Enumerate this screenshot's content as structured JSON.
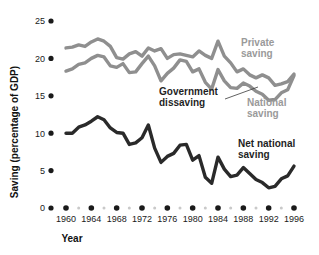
{
  "chart_data": {
    "type": "line",
    "title": "",
    "xlabel": "Year",
    "ylabel": "Saving (percentage of GDP)",
    "xlim": [
      1959,
      1997
    ],
    "ylim": [
      0,
      25
    ],
    "grid": false,
    "legend_position": "inline-annotations",
    "y_ticks": [
      0,
      5,
      10,
      15,
      20,
      25
    ],
    "y_tick_labels": [
      "0",
      "5",
      "10",
      "15",
      "20",
      "25"
    ],
    "x_ticks": [
      1960,
      1964,
      1968,
      1972,
      1976,
      1980,
      1984,
      1988,
      1992,
      1996
    ],
    "x_tick_labels": [
      "1960",
      "1964",
      "1968",
      "1972",
      "1976",
      "1980",
      "1984",
      "1988",
      "1992",
      "1996"
    ],
    "x_minor_ticks": [
      1962,
      1966,
      1970,
      1974,
      1978,
      1982,
      1986,
      1990,
      1994
    ],
    "x": [
      1960,
      1961,
      1962,
      1963,
      1964,
      1965,
      1966,
      1967,
      1968,
      1969,
      1970,
      1971,
      1972,
      1973,
      1974,
      1975,
      1976,
      1977,
      1978,
      1979,
      1980,
      1981,
      1982,
      1983,
      1984,
      1985,
      1986,
      1987,
      1988,
      1989,
      1990,
      1991,
      1992,
      1993,
      1994,
      1995,
      1996
    ],
    "series": [
      {
        "name": "Private saving",
        "color": "#8f8f8f",
        "values": [
          21.4,
          21.5,
          21.8,
          21.6,
          22.2,
          22.6,
          22.3,
          21.6,
          20.1,
          19.9,
          20.6,
          20.9,
          20.3,
          21.4,
          21.0,
          21.3,
          20.0,
          20.5,
          20.6,
          20.4,
          20.2,
          21.0,
          20.4,
          20.0,
          22.3,
          20.3,
          19.4,
          18.2,
          18.6,
          17.8,
          17.4,
          17.8,
          17.4,
          16.4,
          16.6,
          16.9,
          17.9
        ]
      },
      {
        "name": "National saving",
        "color": "#8f8f8f",
        "values": [
          18.3,
          18.6,
          19.2,
          19.4,
          20.0,
          20.4,
          20.2,
          19.0,
          18.8,
          19.3,
          18.1,
          18.2,
          19.3,
          20.3,
          19.0,
          17.0,
          18.0,
          18.7,
          19.8,
          19.6,
          18.2,
          18.6,
          16.8,
          15.9,
          18.5,
          17.0,
          16.1,
          16.0,
          16.7,
          16.3,
          15.6,
          15.2,
          14.4,
          14.5,
          15.4,
          15.8,
          17.7
        ]
      },
      {
        "name": "Net national saving",
        "color": "#2a2a2a",
        "values": [
          10.0,
          10.0,
          10.8,
          11.1,
          11.6,
          12.2,
          11.8,
          10.7,
          10.1,
          10.0,
          8.5,
          8.7,
          9.4,
          11.1,
          8.0,
          6.1,
          6.9,
          7.3,
          8.4,
          8.5,
          6.4,
          7.0,
          4.1,
          3.3,
          6.8,
          5.2,
          4.2,
          4.4,
          5.4,
          4.6,
          3.8,
          3.4,
          2.7,
          2.9,
          3.9,
          4.3,
          5.6
        ]
      }
    ],
    "annotations": [
      {
        "text_line1": "Private",
        "text_line2": "saving",
        "style": "gray",
        "x": 241,
        "y": 46
      },
      {
        "text_line1": "National",
        "text_line2": "saving",
        "style": "gray",
        "x": 247,
        "y": 106
      },
      {
        "text_line1": "Government",
        "text_line2": "dissaving",
        "style": "dark",
        "x": 159,
        "y": 95
      },
      {
        "text_line1": "Net national",
        "text_line2": "saving",
        "style": "dark",
        "x": 238,
        "y": 147
      }
    ],
    "leader_line": {
      "x1": 225,
      "y1": 99,
      "x2": 258,
      "y2": 87
    },
    "colors": {
      "private_saving": "#8f8f8f",
      "national_saving": "#8f8f8f",
      "net_national_saving": "#2a2a2a",
      "axis_text": "#1a1a1a",
      "background": "#ffffff"
    }
  }
}
